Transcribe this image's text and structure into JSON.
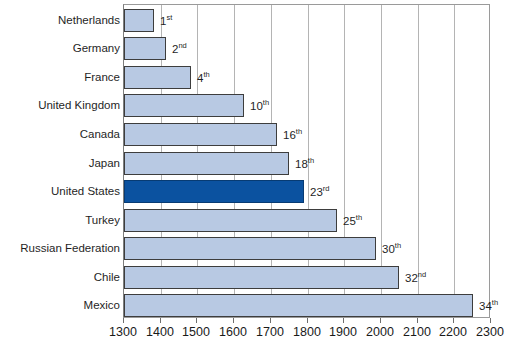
{
  "chart_data": {
    "type": "bar",
    "orientation": "horizontal",
    "title": "",
    "xlabel": "",
    "ylabel": "",
    "xlim": [
      1300,
      2300
    ],
    "xticks": [
      1300,
      1400,
      1500,
      1600,
      1700,
      1800,
      1900,
      2000,
      2100,
      2200,
      2300
    ],
    "xtick_labels": [
      "1300",
      "1400",
      "1500",
      "1600",
      "1700",
      "1800",
      "1900",
      "2000",
      "2100",
      "2200",
      "2300"
    ],
    "grid": true,
    "grid_axis": "x",
    "legend": "none",
    "categories": [
      "Netherlands",
      "Germany",
      "France",
      "United Kingdom",
      "Canada",
      "Japan",
      "United States",
      "Turkey",
      "Russian Federation",
      "Chile",
      "Mexico"
    ],
    "values": [
      1382,
      1415,
      1482,
      1627,
      1717,
      1750,
      1790,
      1880,
      1987,
      2050,
      2250
    ],
    "annotations": [
      {
        "text": "1st",
        "number": "1",
        "suffix": "st",
        "category": "Netherlands"
      },
      {
        "text": "2nd",
        "number": "2",
        "suffix": "nd",
        "category": "Germany"
      },
      {
        "text": "4th",
        "number": "4",
        "suffix": "th",
        "category": "France"
      },
      {
        "text": "10th",
        "number": "10",
        "suffix": "th",
        "category": "United Kingdom"
      },
      {
        "text": "16th",
        "number": "16",
        "suffix": "th",
        "category": "Canada"
      },
      {
        "text": "18th",
        "number": "18",
        "suffix": "th",
        "category": "Japan"
      },
      {
        "text": "23rd",
        "number": "23",
        "suffix": "rd",
        "category": "United States"
      },
      {
        "text": "25th",
        "number": "25",
        "suffix": "th",
        "category": "Turkey"
      },
      {
        "text": "30th",
        "number": "30",
        "suffix": "th",
        "category": "Russian Federation"
      },
      {
        "text": "32nd",
        "number": "32",
        "suffix": "nd",
        "category": "Chile"
      },
      {
        "text": "34th",
        "number": "34",
        "suffix": "th",
        "category": "Mexico"
      }
    ],
    "highlight_category": "United States",
    "colors": {
      "bar_fill": "#b8c9e3",
      "bar_border": "#3d3d3d",
      "highlight_fill": "#0b52a0",
      "highlight_border": "#073b73",
      "gridline": "#b4b4b4",
      "axis": "#7d7d7d",
      "text": "#1a1a1a",
      "background": "#ffffff"
    }
  }
}
